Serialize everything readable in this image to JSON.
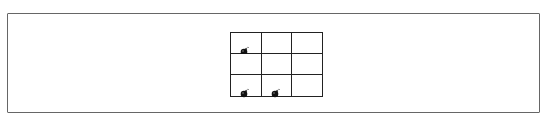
{
  "board": {
    "rows": 3,
    "cols": 3,
    "cells": [
      {
        "row": 0,
        "col": 0,
        "content": "bomb"
      },
      {
        "row": 0,
        "col": 1,
        "content": "empty"
      },
      {
        "row": 0,
        "col": 2,
        "content": "empty"
      },
      {
        "row": 1,
        "col": 0,
        "content": "empty"
      },
      {
        "row": 1,
        "col": 1,
        "content": "empty"
      },
      {
        "row": 1,
        "col": 2,
        "content": "empty"
      },
      {
        "row": 2,
        "col": 0,
        "content": "bomb"
      },
      {
        "row": 2,
        "col": 1,
        "content": "bomb"
      },
      {
        "row": 2,
        "col": 2,
        "content": "empty"
      }
    ]
  },
  "colors": {
    "grid_line": "#222222",
    "frame": "#666666",
    "bomb": "#111111"
  }
}
